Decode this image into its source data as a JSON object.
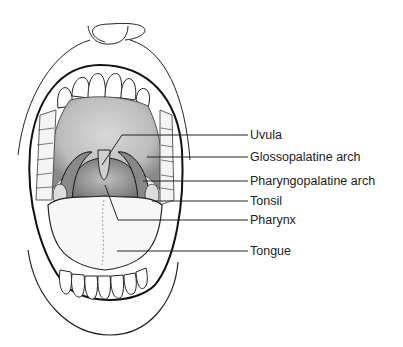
{
  "diagram": {
    "labels": [
      {
        "text": "Uvula",
        "y": 135
      },
      {
        "text": "Glossopalatine arch",
        "y": 157
      },
      {
        "text": "Pharyngopalatine arch",
        "y": 181
      },
      {
        "text": "Tonsil",
        "y": 201
      },
      {
        "text": "Pharynx",
        "y": 220
      },
      {
        "text": "Tongue",
        "y": 251
      }
    ],
    "colors": {
      "ink": "#1a1a1a",
      "shade": "#9a9a9a",
      "background": "#ffffff"
    }
  }
}
